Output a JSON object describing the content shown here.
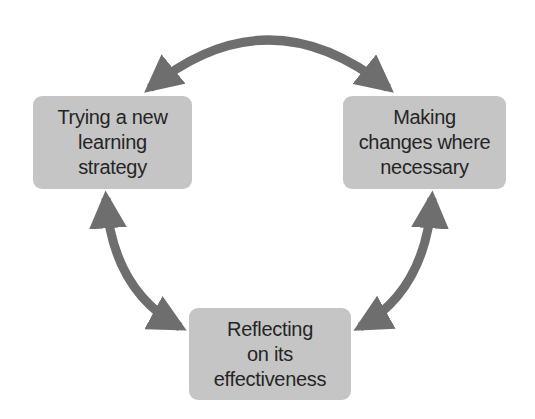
{
  "diagram": {
    "type": "cycle",
    "colors": {
      "box_fill": "#c5c5c5",
      "arrow": "#6e6e6e",
      "text": "#252525",
      "background": "#ffffff"
    },
    "nodes": [
      {
        "id": "trying",
        "lines": [
          "Trying a new",
          "learning",
          "strategy"
        ]
      },
      {
        "id": "making",
        "lines": [
          "Making",
          "changes where",
          "necessary"
        ]
      },
      {
        "id": "reflecting",
        "lines": [
          "Reflecting",
          "on its",
          "effectiveness"
        ]
      }
    ],
    "edges": [
      {
        "from": "trying",
        "to": "making",
        "bidirectional": true
      },
      {
        "from": "making",
        "to": "reflecting",
        "bidirectional": true
      },
      {
        "from": "reflecting",
        "to": "trying",
        "bidirectional": true
      }
    ]
  }
}
